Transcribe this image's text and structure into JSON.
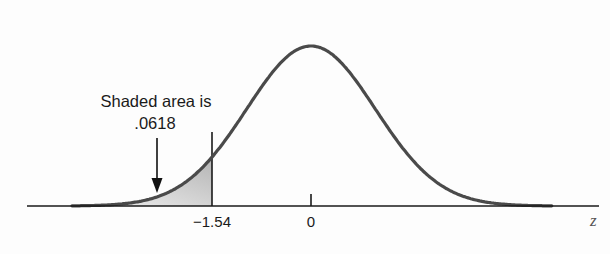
{
  "chart_data": {
    "type": "area",
    "title": "",
    "distribution": "standard normal",
    "xlabel": "z",
    "ylabel": "",
    "x_ticks": [
      {
        "value": -1.54,
        "label": "−1.54"
      },
      {
        "value": 0,
        "label": "0"
      }
    ],
    "xlim": [
      -3.7,
      4.5
    ],
    "shaded_region": {
      "from": "-inf",
      "to": -1.54,
      "area": 0.0618
    },
    "annotation": {
      "line1": "Shaded area is",
      "line2": ".0618",
      "arrow": "points down into shaded region"
    },
    "grid": false,
    "legend": null
  },
  "labels": {
    "annotation_line1": "Shaded area is",
    "annotation_line2": ".0618",
    "tick_neg": "−1.54",
    "tick_zero": "0",
    "axis_var": "z"
  },
  "colors": {
    "curve": "#4a4a4a",
    "axis": "#1a1a1a",
    "shade_top": "#b8b8b8",
    "shade_bottom": "#f2f2f2"
  }
}
